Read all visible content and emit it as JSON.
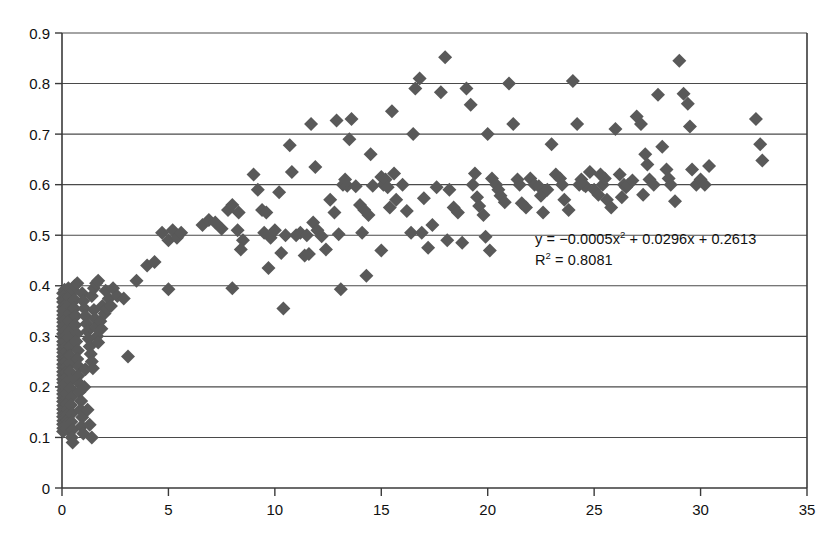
{
  "chart_data": {
    "type": "scatter",
    "title": "",
    "xlabel": "",
    "ylabel": "",
    "xlim": [
      0,
      35
    ],
    "ylim": [
      0,
      0.9
    ],
    "xticks": [
      0,
      5,
      10,
      15,
      20,
      25,
      30,
      35
    ],
    "xtick_labels": [
      "0",
      "5",
      "10",
      "15",
      "20",
      "25",
      "30",
      "35"
    ],
    "yticks": [
      0,
      0.1,
      0.2,
      0.3,
      0.4,
      0.5,
      0.6,
      0.7,
      0.8,
      0.9
    ],
    "ytick_labels": [
      "0",
      "0.1",
      "0.2",
      "0.3",
      "0.4",
      "0.5",
      "0.6",
      "0.7",
      "0.8",
      "0.9"
    ],
    "grid": "horizontal",
    "legend": "none",
    "marker": "diamond",
    "marker_color": "#595959",
    "marker_size": 7,
    "annotations": [
      {
        "name": "trendline-equation",
        "text": "y = −0.0005x² + 0.0296x + 0.2613",
        "x": 17.5,
        "y": 0.48
      },
      {
        "name": "r-squared",
        "text": "R² = 0.8081",
        "x": 17.5,
        "y": 0.445
      }
    ],
    "fit": {
      "type": "quadratic",
      "a": -0.0005,
      "b": 0.0296,
      "c": 0.2613,
      "r_squared": 0.8081,
      "equation_display": "y = −0.0005x² + 0.0296x + 0.2613",
      "r_squared_display": "R² = 0.8081"
    },
    "points": [
      [
        0.05,
        0.385
      ],
      [
        0.05,
        0.375
      ],
      [
        0.05,
        0.368
      ],
      [
        0.06,
        0.358
      ],
      [
        0.05,
        0.35
      ],
      [
        0.06,
        0.342
      ],
      [
        0.05,
        0.335
      ],
      [
        0.06,
        0.328
      ],
      [
        0.05,
        0.32
      ],
      [
        0.06,
        0.313
      ],
      [
        0.05,
        0.305
      ],
      [
        0.06,
        0.298
      ],
      [
        0.05,
        0.29
      ],
      [
        0.06,
        0.283
      ],
      [
        0.05,
        0.275
      ],
      [
        0.06,
        0.268
      ],
      [
        0.05,
        0.26
      ],
      [
        0.06,
        0.253
      ],
      [
        0.05,
        0.245
      ],
      [
        0.06,
        0.238
      ],
      [
        0.05,
        0.23
      ],
      [
        0.06,
        0.223
      ],
      [
        0.05,
        0.215
      ],
      [
        0.06,
        0.208
      ],
      [
        0.05,
        0.2
      ],
      [
        0.06,
        0.193
      ],
      [
        0.05,
        0.186
      ],
      [
        0.06,
        0.178
      ],
      [
        0.05,
        0.171
      ],
      [
        0.06,
        0.163
      ],
      [
        0.05,
        0.156
      ],
      [
        0.06,
        0.148
      ],
      [
        0.05,
        0.141
      ],
      [
        0.06,
        0.133
      ],
      [
        0.05,
        0.126
      ],
      [
        0.06,
        0.118
      ],
      [
        0.05,
        0.112
      ],
      [
        0.12,
        0.392
      ],
      [
        0.14,
        0.383
      ],
      [
        0.13,
        0.372
      ],
      [
        0.15,
        0.362
      ],
      [
        0.13,
        0.352
      ],
      [
        0.16,
        0.342
      ],
      [
        0.14,
        0.331
      ],
      [
        0.17,
        0.321
      ],
      [
        0.15,
        0.311
      ],
      [
        0.18,
        0.3
      ],
      [
        0.16,
        0.29
      ],
      [
        0.19,
        0.28
      ],
      [
        0.17,
        0.27
      ],
      [
        0.2,
        0.259
      ],
      [
        0.18,
        0.249
      ],
      [
        0.21,
        0.239
      ],
      [
        0.19,
        0.228
      ],
      [
        0.22,
        0.218
      ],
      [
        0.2,
        0.208
      ],
      [
        0.23,
        0.197
      ],
      [
        0.21,
        0.187
      ],
      [
        0.24,
        0.177
      ],
      [
        0.22,
        0.166
      ],
      [
        0.25,
        0.156
      ],
      [
        0.23,
        0.146
      ],
      [
        0.26,
        0.135
      ],
      [
        0.24,
        0.125
      ],
      [
        0.27,
        0.115
      ],
      [
        0.3,
        0.395
      ],
      [
        0.33,
        0.378
      ],
      [
        0.31,
        0.362
      ],
      [
        0.35,
        0.345
      ],
      [
        0.32,
        0.33
      ],
      [
        0.37,
        0.312
      ],
      [
        0.34,
        0.296
      ],
      [
        0.39,
        0.28
      ],
      [
        0.36,
        0.262
      ],
      [
        0.41,
        0.246
      ],
      [
        0.38,
        0.23
      ],
      [
        0.43,
        0.213
      ],
      [
        0.4,
        0.197
      ],
      [
        0.45,
        0.18
      ],
      [
        0.42,
        0.164
      ],
      [
        0.47,
        0.148
      ],
      [
        0.44,
        0.131
      ],
      [
        0.49,
        0.115
      ],
      [
        0.46,
        0.1
      ],
      [
        0.5,
        0.09
      ],
      [
        0.55,
        0.39
      ],
      [
        0.6,
        0.372
      ],
      [
        0.58,
        0.355
      ],
      [
        0.65,
        0.34
      ],
      [
        0.62,
        0.322
      ],
      [
        0.7,
        0.305
      ],
      [
        0.67,
        0.29
      ],
      [
        0.75,
        0.272
      ],
      [
        0.72,
        0.255
      ],
      [
        0.8,
        0.24
      ],
      [
        0.77,
        0.222
      ],
      [
        0.85,
        0.205
      ],
      [
        0.82,
        0.19
      ],
      [
        0.9,
        0.172
      ],
      [
        0.87,
        0.155
      ],
      [
        0.95,
        0.14
      ],
      [
        0.92,
        0.122
      ],
      [
        1.0,
        0.108
      ],
      [
        1.05,
        0.2
      ],
      [
        1.1,
        0.235
      ],
      [
        0.6,
        0.4
      ],
      [
        0.72,
        0.405
      ],
      [
        0.95,
        0.385
      ],
      [
        1.0,
        0.37
      ],
      [
        1.05,
        0.355
      ],
      [
        1.1,
        0.34
      ],
      [
        1.15,
        0.325
      ],
      [
        1.2,
        0.31
      ],
      [
        1.25,
        0.295
      ],
      [
        1.3,
        0.28
      ],
      [
        1.35,
        0.265
      ],
      [
        1.4,
        0.25
      ],
      [
        1.45,
        0.237
      ],
      [
        1.5,
        0.352
      ],
      [
        1.55,
        0.335
      ],
      [
        1.6,
        0.318
      ],
      [
        1.65,
        0.3
      ],
      [
        1.7,
        0.288
      ],
      [
        1.8,
        0.33
      ],
      [
        1.85,
        0.315
      ],
      [
        1.4,
        0.38
      ],
      [
        1.5,
        0.395
      ],
      [
        1.6,
        0.405
      ],
      [
        1.7,
        0.41
      ],
      [
        1.9,
        0.36
      ],
      [
        2.0,
        0.345
      ],
      [
        2.1,
        0.355
      ],
      [
        2.2,
        0.375
      ],
      [
        2.3,
        0.36
      ],
      [
        1.2,
        0.155
      ],
      [
        1.3,
        0.125
      ],
      [
        1.4,
        0.1
      ],
      [
        2.05,
        0.39
      ],
      [
        2.4,
        0.395
      ],
      [
        2.6,
        0.38
      ],
      [
        2.9,
        0.375
      ],
      [
        3.1,
        0.26
      ],
      [
        3.5,
        0.41
      ],
      [
        4.0,
        0.44
      ],
      [
        4.35,
        0.447
      ],
      [
        4.7,
        0.505
      ],
      [
        5.0,
        0.49
      ],
      [
        5.2,
        0.51
      ],
      [
        5.4,
        0.495
      ],
      [
        5.6,
        0.505
      ],
      [
        5.0,
        0.393
      ],
      [
        6.6,
        0.52
      ],
      [
        6.9,
        0.53
      ],
      [
        7.2,
        0.525
      ],
      [
        7.5,
        0.513
      ],
      [
        7.8,
        0.55
      ],
      [
        8.0,
        0.56
      ],
      [
        8.25,
        0.51
      ],
      [
        8.5,
        0.49
      ],
      [
        8.4,
        0.472
      ],
      [
        8.3,
        0.545
      ],
      [
        8.0,
        0.395
      ],
      [
        9.0,
        0.62
      ],
      [
        9.2,
        0.59
      ],
      [
        9.4,
        0.55
      ],
      [
        9.6,
        0.545
      ],
      [
        9.5,
        0.505
      ],
      [
        9.8,
        0.495
      ],
      [
        9.7,
        0.435
      ],
      [
        10.0,
        0.51
      ],
      [
        10.2,
        0.585
      ],
      [
        10.3,
        0.465
      ],
      [
        10.5,
        0.5
      ],
      [
        10.4,
        0.355
      ],
      [
        10.7,
        0.678
      ],
      [
        10.8,
        0.625
      ],
      [
        11.0,
        0.5
      ],
      [
        11.2,
        0.505
      ],
      [
        11.4,
        0.46
      ],
      [
        11.6,
        0.463
      ],
      [
        11.8,
        0.525
      ],
      [
        11.9,
        0.635
      ],
      [
        11.7,
        0.72
      ],
      [
        11.5,
        0.5
      ],
      [
        12.0,
        0.51
      ],
      [
        12.2,
        0.498
      ],
      [
        12.4,
        0.472
      ],
      [
        12.6,
        0.57
      ],
      [
        12.8,
        0.545
      ],
      [
        12.9,
        0.727
      ],
      [
        13.0,
        0.502
      ],
      [
        13.2,
        0.6
      ],
      [
        13.4,
        0.598
      ],
      [
        13.3,
        0.61
      ],
      [
        13.5,
        0.69
      ],
      [
        13.6,
        0.73
      ],
      [
        13.1,
        0.393
      ],
      [
        13.8,
        0.597
      ],
      [
        14.0,
        0.56
      ],
      [
        14.2,
        0.55
      ],
      [
        14.1,
        0.505
      ],
      [
        14.4,
        0.54
      ],
      [
        14.5,
        0.66
      ],
      [
        14.6,
        0.598
      ],
      [
        14.3,
        0.42
      ],
      [
        15.0,
        0.615
      ],
      [
        15.1,
        0.6
      ],
      [
        15.2,
        0.61
      ],
      [
        15.3,
        0.595
      ],
      [
        15.4,
        0.555
      ],
      [
        15.5,
        0.745
      ],
      [
        15.6,
        0.622
      ],
      [
        15.7,
        0.57
      ],
      [
        15.0,
        0.47
      ],
      [
        16.0,
        0.6
      ],
      [
        16.2,
        0.548
      ],
      [
        16.4,
        0.505
      ],
      [
        16.6,
        0.79
      ],
      [
        16.8,
        0.81
      ],
      [
        16.5,
        0.7
      ],
      [
        16.9,
        0.505
      ],
      [
        17.2,
        0.475
      ],
      [
        17.4,
        0.52
      ],
      [
        17.0,
        0.573
      ],
      [
        17.6,
        0.595
      ],
      [
        17.8,
        0.783
      ],
      [
        18.0,
        0.852
      ],
      [
        18.2,
        0.59
      ],
      [
        18.4,
        0.555
      ],
      [
        18.6,
        0.545
      ],
      [
        18.1,
        0.49
      ],
      [
        18.8,
        0.485
      ],
      [
        19.0,
        0.79
      ],
      [
        19.2,
        0.758
      ],
      [
        19.4,
        0.622
      ],
      [
        19.3,
        0.6
      ],
      [
        19.5,
        0.575
      ],
      [
        19.6,
        0.558
      ],
      [
        19.8,
        0.54
      ],
      [
        19.9,
        0.497
      ],
      [
        20.0,
        0.7
      ],
      [
        20.2,
        0.612
      ],
      [
        20.4,
        0.6
      ],
      [
        20.5,
        0.59
      ],
      [
        20.6,
        0.578
      ],
      [
        20.8,
        0.565
      ],
      [
        20.1,
        0.47
      ],
      [
        21.0,
        0.8
      ],
      [
        21.2,
        0.72
      ],
      [
        21.4,
        0.61
      ],
      [
        21.5,
        0.6
      ],
      [
        21.6,
        0.563
      ],
      [
        21.8,
        0.555
      ],
      [
        22.0,
        0.612
      ],
      [
        22.2,
        0.6
      ],
      [
        22.4,
        0.597
      ],
      [
        22.5,
        0.578
      ],
      [
        22.6,
        0.545
      ],
      [
        22.8,
        0.59
      ],
      [
        23.0,
        0.68
      ],
      [
        23.2,
        0.62
      ],
      [
        23.4,
        0.612
      ],
      [
        23.5,
        0.6
      ],
      [
        23.6,
        0.57
      ],
      [
        23.8,
        0.55
      ],
      [
        24.0,
        0.805
      ],
      [
        24.2,
        0.72
      ],
      [
        24.4,
        0.61
      ],
      [
        24.5,
        0.6
      ],
      [
        24.6,
        0.597
      ],
      [
        24.8,
        0.625
      ],
      [
        25.0,
        0.59
      ],
      [
        25.2,
        0.58
      ],
      [
        25.4,
        0.6
      ],
      [
        25.5,
        0.612
      ],
      [
        25.6,
        0.57
      ],
      [
        25.8,
        0.555
      ],
      [
        26.0,
        0.71
      ],
      [
        26.2,
        0.62
      ],
      [
        26.4,
        0.6
      ],
      [
        26.5,
        0.595
      ],
      [
        26.6,
        0.6
      ],
      [
        26.8,
        0.608
      ],
      [
        27.0,
        0.735
      ],
      [
        27.2,
        0.72
      ],
      [
        27.4,
        0.66
      ],
      [
        27.5,
        0.64
      ],
      [
        27.6,
        0.61
      ],
      [
        27.8,
        0.6
      ],
      [
        28.0,
        0.778
      ],
      [
        28.2,
        0.675
      ],
      [
        28.4,
        0.63
      ],
      [
        28.5,
        0.612
      ],
      [
        28.6,
        0.6
      ],
      [
        28.8,
        0.567
      ],
      [
        29.0,
        0.845
      ],
      [
        29.2,
        0.78
      ],
      [
        29.4,
        0.76
      ],
      [
        29.5,
        0.715
      ],
      [
        29.6,
        0.63
      ],
      [
        29.8,
        0.6
      ],
      [
        30.0,
        0.61
      ],
      [
        30.2,
        0.6
      ],
      [
        30.4,
        0.637
      ],
      [
        27.3,
        0.58
      ],
      [
        26.3,
        0.575
      ],
      [
        25.3,
        0.62
      ],
      [
        24.3,
        0.6
      ],
      [
        32.6,
        0.73
      ],
      [
        32.8,
        0.68
      ],
      [
        32.9,
        0.648
      ]
    ]
  },
  "axes": {
    "x_axis_name": "x-axis",
    "y_axis_name": "y-axis"
  }
}
